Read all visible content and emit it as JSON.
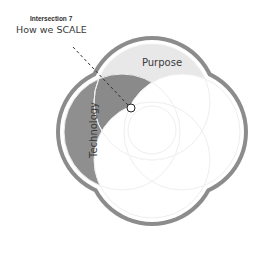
{
  "callout": {
    "title": "Intersection 7",
    "subtitle": "How we SCALE"
  },
  "circles": [
    {
      "id": "purpose",
      "label": "Purpose",
      "fill": "#e8e8e8"
    },
    {
      "id": "technology",
      "label": "Technology",
      "fill": "#8f8f8f"
    },
    {
      "id": "right",
      "label": "",
      "fill": "#ffffff"
    },
    {
      "id": "bottom",
      "label": "",
      "fill": "#ffffff"
    }
  ],
  "colors": {
    "outline": "#8c8c8c",
    "intersection": "#8a8a8a",
    "circle_stroke": "#eeeeee",
    "marker_fill": "#ffffff",
    "marker_stroke": "#222222",
    "leader_line": "#333333"
  }
}
